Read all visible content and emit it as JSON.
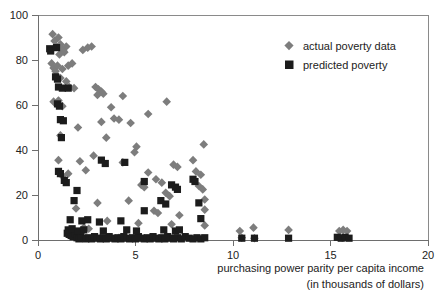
{
  "chart_data": {
    "type": "scatter",
    "title": "",
    "xlabel": "purchasing power parity per capita income",
    "xlabel_line2": "(in thousands of dollars)",
    "ylabel": "",
    "xlim": [
      0,
      20
    ],
    "ylim": [
      0,
      100
    ],
    "xticks": [
      0,
      5,
      10,
      15,
      20
    ],
    "yticks": [
      0,
      20,
      40,
      60,
      80,
      100
    ],
    "xtick_labels": [
      "0",
      "5",
      "10",
      "15",
      "20"
    ],
    "ytick_labels": [
      "0",
      "20",
      "40",
      "60",
      "80",
      "100"
    ],
    "grid": false,
    "legend_position": "top-right",
    "series": [
      {
        "name": "actual poverty data",
        "marker": "diamond",
        "color": "#7d7d7d",
        "points": [
          [
            0.75,
            91.5
          ],
          [
            0.85,
            88.5
          ],
          [
            0.95,
            86.0
          ],
          [
            1.05,
            90.0
          ],
          [
            1.15,
            87.0
          ],
          [
            1.25,
            85.0
          ],
          [
            1.35,
            83.5
          ],
          [
            1.45,
            86.0
          ],
          [
            1.3,
            84.0
          ],
          [
            1.1,
            82.5
          ],
          [
            2.3,
            84.5
          ],
          [
            2.55,
            85.5
          ],
          [
            2.75,
            86.0
          ],
          [
            0.7,
            78.5
          ],
          [
            0.8,
            76.5
          ],
          [
            0.9,
            75.0
          ],
          [
            1.0,
            77.5
          ],
          [
            1.25,
            76.0
          ],
          [
            1.55,
            77.5
          ],
          [
            1.75,
            78.5
          ],
          [
            0.95,
            73.0
          ],
          [
            1.15,
            72.0
          ],
          [
            1.45,
            70.5
          ],
          [
            1.6,
            68.0
          ],
          [
            1.85,
            67.5
          ],
          [
            2.95,
            68.0
          ],
          [
            3.1,
            67.0
          ],
          [
            3.25,
            66.0
          ],
          [
            3.35,
            65.0
          ],
          [
            3.05,
            64.5
          ],
          [
            4.35,
            64.0
          ],
          [
            6.6,
            61.5
          ],
          [
            0.8,
            61.5
          ],
          [
            0.95,
            60.5
          ],
          [
            1.05,
            62.0
          ],
          [
            1.25,
            59.5
          ],
          [
            3.75,
            59.0
          ],
          [
            3.9,
            54.0
          ],
          [
            4.15,
            53.5
          ],
          [
            5.65,
            56.0
          ],
          [
            3.25,
            52.5
          ],
          [
            4.75,
            52.0
          ],
          [
            2.05,
            50.0
          ],
          [
            3.5,
            45.5
          ],
          [
            1.15,
            46.5
          ],
          [
            8.5,
            42.5
          ],
          [
            5.05,
            41.5
          ],
          [
            4.95,
            39.0
          ],
          [
            7.95,
            35.5
          ],
          [
            1.05,
            35.5
          ],
          [
            2.85,
            37.5
          ],
          [
            2.15,
            35.0
          ],
          [
            4.35,
            34.5
          ],
          [
            6.95,
            33.5
          ],
          [
            7.15,
            32.5
          ],
          [
            8.1,
            30.5
          ],
          [
            8.35,
            29.0
          ],
          [
            5.65,
            30.0
          ],
          [
            2.45,
            31.0
          ],
          [
            1.55,
            29.5
          ],
          [
            1.25,
            28.5
          ],
          [
            6.05,
            27.0
          ],
          [
            6.35,
            25.5
          ],
          [
            5.3,
            24.5
          ],
          [
            5.45,
            23.5
          ],
          [
            8.25,
            24.0
          ],
          [
            8.45,
            22.5
          ],
          [
            6.55,
            21.0
          ],
          [
            6.75,
            19.5
          ],
          [
            4.65,
            17.5
          ],
          [
            8.55,
            18.0
          ],
          [
            3.05,
            16.5
          ],
          [
            1.95,
            14.0
          ],
          [
            5.95,
            13.0
          ],
          [
            6.15,
            12.0
          ],
          [
            7.25,
            11.0
          ],
          [
            8.55,
            13.5
          ],
          [
            3.55,
            8.5
          ],
          [
            5.15,
            7.5
          ],
          [
            6.85,
            7.0
          ],
          [
            8.55,
            6.5
          ],
          [
            2.35,
            5.5
          ],
          [
            2.6,
            5.0
          ],
          [
            4.15,
            1.0
          ],
          [
            10.35,
            4.0
          ],
          [
            11.05,
            5.5
          ],
          [
            12.85,
            4.5
          ],
          [
            15.45,
            4.0
          ],
          [
            15.65,
            4.5
          ],
          [
            15.85,
            4.0
          ],
          [
            10.45,
            1.0
          ],
          [
            11.1,
            0.8
          ],
          [
            15.6,
            1.0
          ]
        ]
      },
      {
        "name": "predicted poverty",
        "marker": "square",
        "color": "#1c1c1c",
        "points": [
          [
            0.6,
            85.0
          ],
          [
            0.65,
            84.0
          ],
          [
            0.95,
            85.5
          ],
          [
            0.9,
            72.5
          ],
          [
            1.0,
            71.5
          ],
          [
            1.05,
            68.0
          ],
          [
            1.25,
            67.5
          ],
          [
            1.55,
            67.5
          ],
          [
            1.0,
            60.5
          ],
          [
            1.1,
            59.5
          ],
          [
            1.15,
            53.5
          ],
          [
            1.3,
            53.0
          ],
          [
            1.2,
            45.5
          ],
          [
            1.05,
            30.5
          ],
          [
            1.15,
            29.5
          ],
          [
            3.25,
            35.5
          ],
          [
            3.45,
            34.0
          ],
          [
            4.45,
            34.5
          ],
          [
            1.35,
            26.5
          ],
          [
            1.45,
            25.5
          ],
          [
            2.0,
            22.0
          ],
          [
            1.85,
            17.5
          ],
          [
            5.45,
            26.0
          ],
          [
            6.85,
            24.5
          ],
          [
            7.05,
            23.5
          ],
          [
            7.15,
            22.5
          ],
          [
            7.95,
            27.0
          ],
          [
            8.05,
            26.0
          ],
          [
            6.3,
            17.5
          ],
          [
            6.55,
            16.0
          ],
          [
            8.25,
            16.5
          ],
          [
            5.45,
            13.0
          ],
          [
            8.35,
            9.5
          ],
          [
            1.65,
            9.0
          ],
          [
            2.25,
            8.5
          ],
          [
            2.55,
            9.0
          ],
          [
            3.15,
            8.0
          ],
          [
            4.25,
            8.5
          ],
          [
            1.5,
            3.0
          ],
          [
            1.6,
            2.5
          ],
          [
            1.7,
            2.0
          ],
          [
            1.8,
            1.5
          ],
          [
            1.9,
            2.5
          ],
          [
            2.0,
            1.0
          ],
          [
            2.1,
            0.5
          ],
          [
            2.2,
            1.5
          ],
          [
            2.3,
            0.8
          ],
          [
            2.45,
            0.5
          ],
          [
            2.6,
            1.0
          ],
          [
            2.75,
            0.5
          ],
          [
            2.9,
            1.5
          ],
          [
            3.05,
            0.8
          ],
          [
            3.2,
            0.5
          ],
          [
            3.35,
            1.0
          ],
          [
            3.5,
            0.5
          ],
          [
            3.65,
            1.5
          ],
          [
            3.8,
            0.8
          ],
          [
            3.95,
            0.5
          ],
          [
            4.1,
            1.0
          ],
          [
            4.25,
            0.5
          ],
          [
            4.4,
            1.5
          ],
          [
            4.55,
            0.8
          ],
          [
            4.7,
            0.5
          ],
          [
            4.85,
            1.0
          ],
          [
            5.0,
            0.5
          ],
          [
            5.15,
            1.5
          ],
          [
            5.3,
            0.8
          ],
          [
            5.45,
            0.5
          ],
          [
            5.6,
            1.0
          ],
          [
            5.75,
            0.5
          ],
          [
            5.9,
            1.5
          ],
          [
            6.05,
            0.8
          ],
          [
            6.2,
            0.5
          ],
          [
            6.35,
            1.0
          ],
          [
            6.5,
            0.5
          ],
          [
            6.65,
            1.5
          ],
          [
            6.8,
            0.8
          ],
          [
            6.95,
            0.5
          ],
          [
            7.15,
            1.0
          ],
          [
            7.35,
            0.5
          ],
          [
            7.55,
            1.5
          ],
          [
            7.75,
            0.8
          ],
          [
            7.95,
            0.5
          ],
          [
            8.15,
            1.0
          ],
          [
            8.35,
            0.5
          ],
          [
            8.55,
            1.0
          ],
          [
            1.55,
            4.5
          ],
          [
            1.75,
            5.0
          ],
          [
            2.05,
            4.0
          ],
          [
            2.35,
            4.5
          ],
          [
            3.35,
            4.0
          ],
          [
            4.55,
            4.5
          ],
          [
            5.05,
            4.0
          ],
          [
            6.45,
            4.5
          ],
          [
            7.05,
            4.0
          ],
          [
            7.25,
            4.5
          ],
          [
            10.45,
            0.8
          ],
          [
            11.1,
            0.8
          ],
          [
            12.85,
            0.8
          ],
          [
            15.35,
            1.2
          ],
          [
            15.55,
            0.8
          ],
          [
            15.75,
            1.2
          ],
          [
            15.95,
            0.8
          ]
        ]
      }
    ]
  },
  "legend": {
    "items": [
      {
        "label": "actual poverty data",
        "marker": "diamond"
      },
      {
        "label": "predicted poverty",
        "marker": "square"
      }
    ]
  }
}
